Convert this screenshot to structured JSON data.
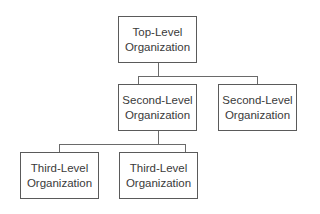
{
  "diagram": {
    "type": "org-chart",
    "nodes": {
      "top": {
        "line1": "Top-Level",
        "line2": "Organization"
      },
      "second_left": {
        "line1": "Second-Level",
        "line2": "Organization"
      },
      "second_right": {
        "line1": "Second-Level",
        "line2": "Organization"
      },
      "third_left": {
        "line1": "Third-Level",
        "line2": "Organization"
      },
      "third_right": {
        "line1": "Third-Level",
        "line2": "Organization"
      }
    },
    "edges": [
      {
        "from": "top",
        "to": "second_left"
      },
      {
        "from": "top",
        "to": "second_right"
      },
      {
        "from": "second_left",
        "to": "third_left"
      },
      {
        "from": "second_left",
        "to": "third_right"
      }
    ],
    "colors": {
      "border": "#5a5a5a",
      "text": "#3a3a3a",
      "connector": "#6a6a6a",
      "background": "#ffffff"
    }
  }
}
